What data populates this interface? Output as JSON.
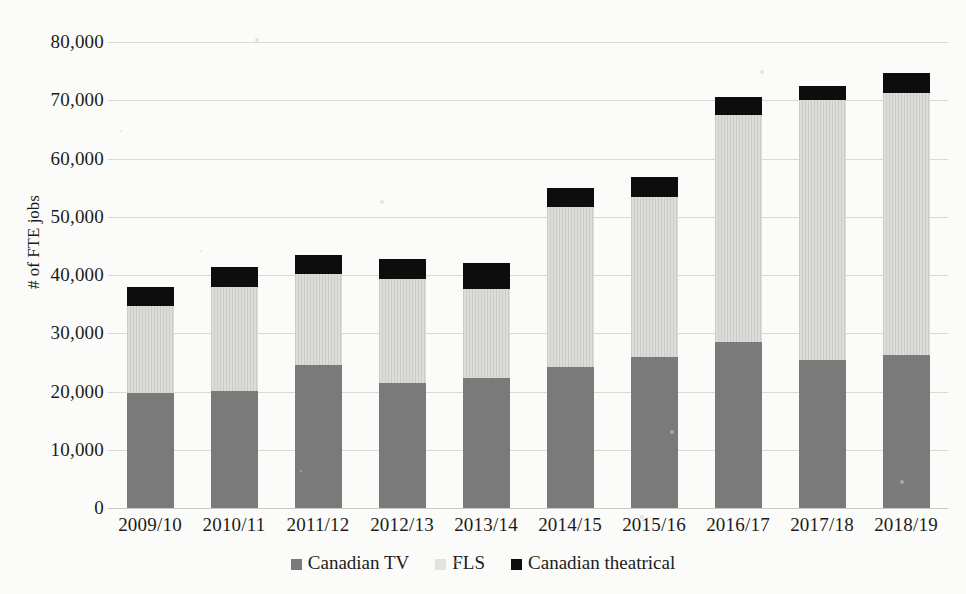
{
  "chart_data": {
    "type": "bar",
    "subtype": "stacked",
    "title": "",
    "xlabel": "",
    "ylabel": "# of FTE jobs",
    "ylim": [
      0,
      80000
    ],
    "ytick_step": 10000,
    "ytick_labels": [
      "80,000",
      "70,000",
      "60,000",
      "50,000",
      "40,000",
      "30,000",
      "20,000",
      "10,000",
      "0"
    ],
    "ytick_values": [
      80000,
      70000,
      60000,
      50000,
      40000,
      30000,
      20000,
      10000,
      0
    ],
    "grid": true,
    "legend_position": "bottom",
    "categories": [
      "2009/10",
      "2010/11",
      "2011/12",
      "2012/13",
      "2013/14",
      "2014/15",
      "2015/16",
      "2016/17",
      "2017/18",
      "2018/19"
    ],
    "series": [
      {
        "name": "Canadian TV",
        "color": "#7a7a7a",
        "values": [
          19800,
          20100,
          24600,
          21500,
          22300,
          24200,
          25900,
          28500,
          25400,
          26300
        ]
      },
      {
        "name": "FLS",
        "color": "#dcdcd8",
        "values": [
          14800,
          17800,
          15500,
          17900,
          15300,
          27400,
          27500,
          38900,
          44600,
          44900
        ]
      },
      {
        "name": "Canadian theatrical",
        "color": "#0d0d0d",
        "values": [
          3400,
          3400,
          3400,
          3400,
          4500,
          3300,
          3400,
          3100,
          2400,
          3400
        ]
      }
    ],
    "totals": [
      38000,
      41300,
      43500,
      42800,
      42100,
      54900,
      56800,
      70500,
      72400,
      74600
    ]
  },
  "legend": {
    "items": [
      {
        "label": "Canadian TV",
        "swatch": "square-icon-gray"
      },
      {
        "label": "FLS",
        "swatch": "square-icon-light"
      },
      {
        "label": "Canadian theatrical",
        "swatch": "square-icon-black"
      }
    ]
  }
}
